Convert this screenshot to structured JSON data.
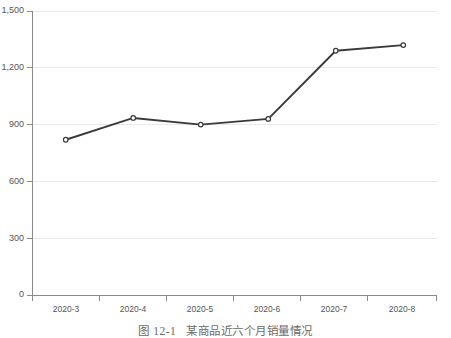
{
  "chart_data": {
    "type": "line",
    "title": "",
    "categories": [
      "2020-3",
      "2020-4",
      "2020-5",
      "2020-6",
      "2020-7",
      "2020-8"
    ],
    "values": [
      820,
      935,
      900,
      930,
      1290,
      1320
    ],
    "series": [
      {
        "name": "销量",
        "values": [
          820,
          935,
          900,
          930,
          1290,
          1320
        ]
      }
    ],
    "xlabel": "",
    "ylabel": "",
    "ylim": [
      0,
      1500
    ],
    "yticks": [
      0,
      300,
      600,
      900,
      1200,
      1500
    ],
    "ytick_labels": [
      "0",
      "300",
      "600",
      "900",
      "1,200",
      "1,500"
    ],
    "grid": true,
    "legend": false,
    "marker": "open-circle",
    "line_color": "#3a3a3a",
    "grid_color": "#e9e9e9",
    "axis_color": "#8a8a8a"
  },
  "caption": {
    "number": "图 12-1",
    "text": "某商品近六个月销量情况"
  }
}
